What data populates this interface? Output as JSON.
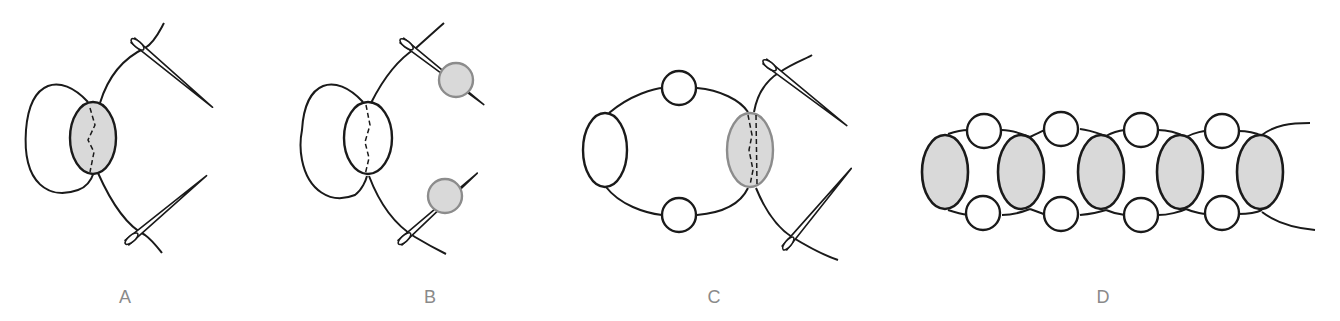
{
  "figure": {
    "panels": [
      {
        "id": "A",
        "label": "A",
        "description": "One shaded bead with thread passing through; two needles at thread ends; left thread loop"
      },
      {
        "id": "B",
        "label": "B",
        "description": "Bead unshaded; a new shaded round bead added on each needle"
      },
      {
        "id": "C",
        "label": "C",
        "description": "Ring of beads formed; new shaded oval bead joined with needles crossing through"
      },
      {
        "id": "D",
        "label": "D",
        "description": "Finished chain of five shaded oval beads linked by pairs of small round beads"
      }
    ],
    "colors": {
      "stroke": "#1a1a1a",
      "bead_fill": "#d9d9d9",
      "bead_stroke_gray": "#8c8c8c",
      "label": "#8a8a8a",
      "background": "#ffffff"
    }
  }
}
